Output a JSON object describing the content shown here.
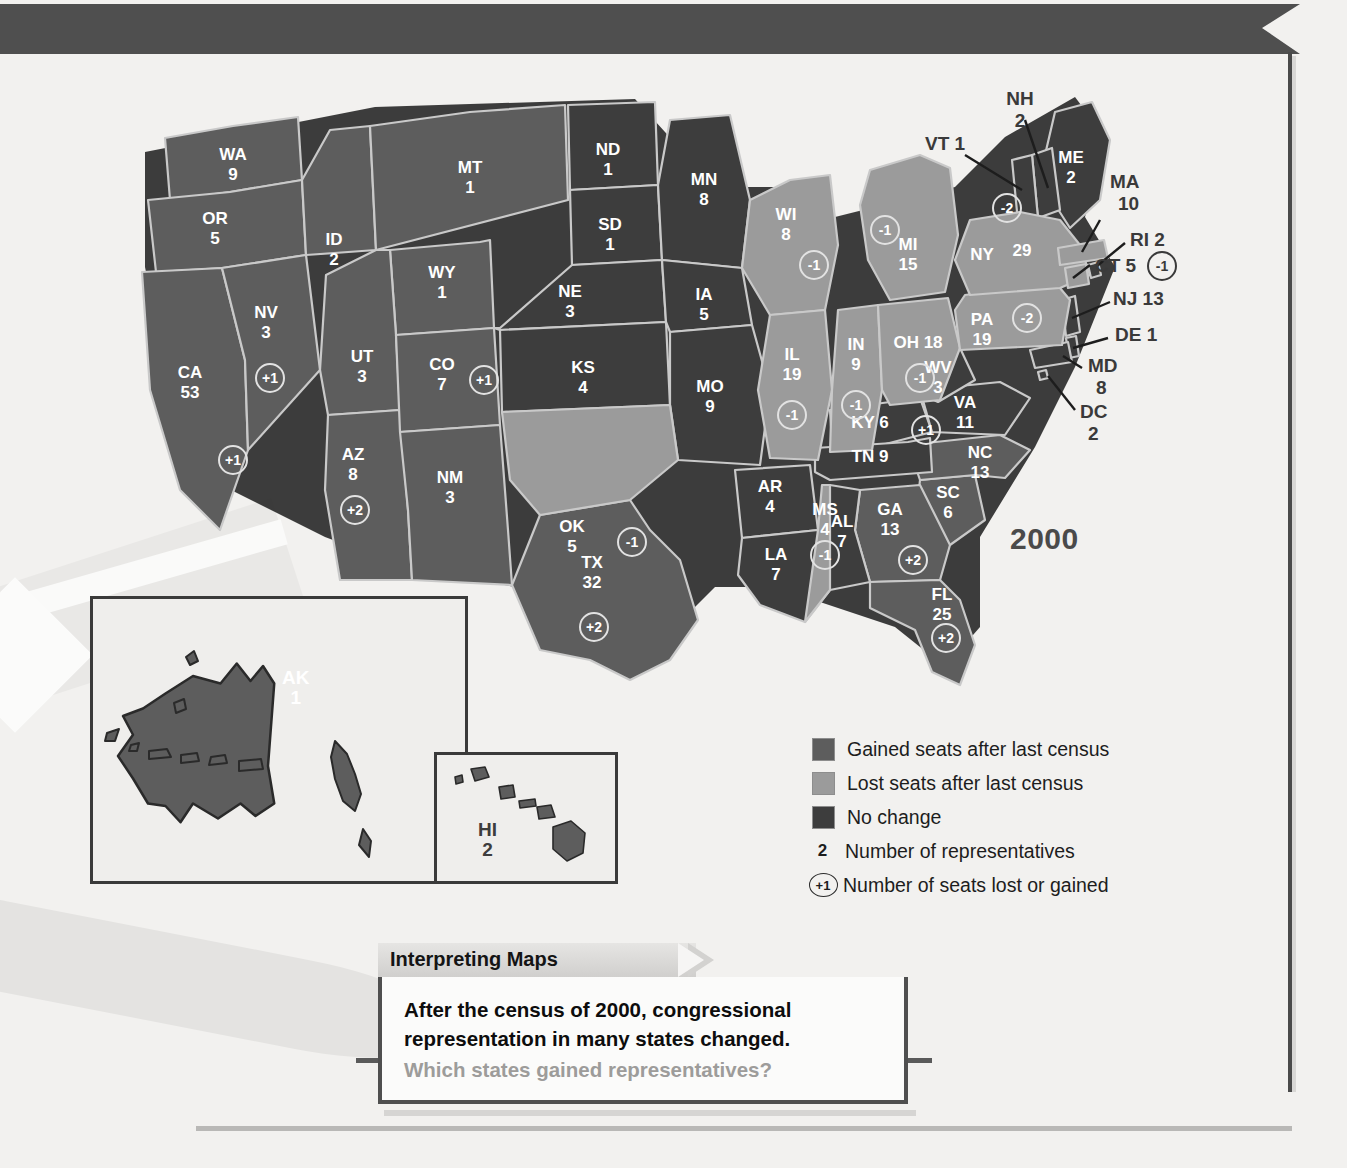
{
  "map": {
    "year_label": "2000",
    "title_domain": "congressional-apportionment-map"
  },
  "states": [
    {
      "code": "WA",
      "reps": "9",
      "change": null,
      "status": "gain"
    },
    {
      "code": "OR",
      "reps": "5",
      "change": null,
      "status": "gain"
    },
    {
      "code": "CA",
      "reps": "53",
      "change": "+1",
      "status": "gain"
    },
    {
      "code": "NV",
      "reps": "3",
      "change": "+1",
      "status": "gain"
    },
    {
      "code": "ID",
      "reps": "2",
      "change": null,
      "status": "gain"
    },
    {
      "code": "MT",
      "reps": "1",
      "change": null,
      "status": "gain"
    },
    {
      "code": "WY",
      "reps": "1",
      "change": null,
      "status": "gain"
    },
    {
      "code": "UT",
      "reps": "3",
      "change": null,
      "status": "gain"
    },
    {
      "code": "AZ",
      "reps": "8",
      "change": "+2",
      "status": "gain"
    },
    {
      "code": "CO",
      "reps": "7",
      "change": "+1",
      "status": "gain"
    },
    {
      "code": "NM",
      "reps": "3",
      "change": null,
      "status": "gain"
    },
    {
      "code": "ND",
      "reps": "1",
      "change": null,
      "status": "same"
    },
    {
      "code": "SD",
      "reps": "1",
      "change": null,
      "status": "same"
    },
    {
      "code": "NE",
      "reps": "3",
      "change": null,
      "status": "same"
    },
    {
      "code": "KS",
      "reps": "4",
      "change": null,
      "status": "same"
    },
    {
      "code": "OK",
      "reps": "5",
      "change": "-1",
      "status": "lose"
    },
    {
      "code": "TX",
      "reps": "32",
      "change": "+2",
      "status": "gain"
    },
    {
      "code": "MN",
      "reps": "8",
      "change": null,
      "status": "same"
    },
    {
      "code": "IA",
      "reps": "5",
      "change": null,
      "status": "same"
    },
    {
      "code": "MO",
      "reps": "9",
      "change": null,
      "status": "same"
    },
    {
      "code": "AR",
      "reps": "4",
      "change": null,
      "status": "same"
    },
    {
      "code": "LA",
      "reps": "7",
      "change": null,
      "status": "same"
    },
    {
      "code": "WI",
      "reps": "8",
      "change": "-1",
      "status": "lose"
    },
    {
      "code": "IL",
      "reps": "19",
      "change": "-1",
      "status": "lose"
    },
    {
      "code": "MI",
      "reps": "15",
      "change": "-1",
      "status": "lose"
    },
    {
      "code": "IN",
      "reps": "9",
      "change": "-1",
      "status": "lose"
    },
    {
      "code": "OH",
      "reps": "18",
      "change": "-1",
      "status": "lose"
    },
    {
      "code": "KY",
      "reps": "6",
      "change": null,
      "status": "same"
    },
    {
      "code": "TN",
      "reps": "9",
      "change": null,
      "status": "same"
    },
    {
      "code": "MS",
      "reps": "4",
      "change": "-1",
      "status": "lose"
    },
    {
      "code": "AL",
      "reps": "7",
      "change": null,
      "status": "same"
    },
    {
      "code": "GA",
      "reps": "13",
      "change": "+2",
      "status": "gain"
    },
    {
      "code": "FL",
      "reps": "25",
      "change": "+2",
      "status": "gain"
    },
    {
      "code": "SC",
      "reps": "6",
      "change": null,
      "status": "gain"
    },
    {
      "code": "NC",
      "reps": "13",
      "change": "+1",
      "status": "gain"
    },
    {
      "code": "VA",
      "reps": "11",
      "change": null,
      "status": "same"
    },
    {
      "code": "WV",
      "reps": "3",
      "change": null,
      "status": "same"
    },
    {
      "code": "PA",
      "reps": "19",
      "change": "-2",
      "status": "lose"
    },
    {
      "code": "NY",
      "reps": "29",
      "change": "-2",
      "status": "lose"
    },
    {
      "code": "ME",
      "reps": "2",
      "change": null,
      "status": "same"
    },
    {
      "code": "NH",
      "reps": "2",
      "change": null,
      "status": "same"
    },
    {
      "code": "VT",
      "reps": "1",
      "change": null,
      "status": "same"
    },
    {
      "code": "MA",
      "reps": "10",
      "change": null,
      "status": "lose"
    },
    {
      "code": "RI",
      "reps": "2",
      "change": null,
      "status": "same"
    },
    {
      "code": "CT",
      "reps": "5",
      "change": "-1",
      "status": "lose"
    },
    {
      "code": "NJ",
      "reps": "13",
      "change": null,
      "status": "same"
    },
    {
      "code": "DE",
      "reps": "1",
      "change": null,
      "status": "same"
    },
    {
      "code": "MD",
      "reps": "8",
      "change": null,
      "status": "same"
    },
    {
      "code": "DC",
      "reps": "2",
      "change": null,
      "status": "same"
    },
    {
      "code": "AK",
      "reps": "1",
      "change": null,
      "status": "gain"
    },
    {
      "code": "HI",
      "reps": "2",
      "change": null,
      "status": "gain"
    }
  ],
  "state_labels": {
    "WA": "WA",
    "WA_n": "9",
    "OR": "OR",
    "OR_n": "5",
    "CA": "CA",
    "CA_n": "53",
    "NV": "NV",
    "NV_n": "3",
    "ID": "ID",
    "ID_n": "2",
    "MT": "MT",
    "MT_n": "1",
    "WY": "WY",
    "WY_n": "1",
    "UT": "UT",
    "UT_n": "3",
    "AZ": "AZ",
    "AZ_n": "8",
    "CO": "CO",
    "CO_n": "7",
    "NM": "NM",
    "NM_n": "3",
    "ND": "ND",
    "ND_n": "1",
    "SD": "SD",
    "SD_n": "1",
    "NE": "NE",
    "NE_n": "3",
    "KS": "KS",
    "KS_n": "4",
    "OK": "OK",
    "OK_n": "5",
    "TX": "TX",
    "TX_n": "32",
    "MN": "MN",
    "MN_n": "8",
    "IA": "IA",
    "IA_n": "5",
    "MO": "MO",
    "MO_n": "9",
    "AR": "AR",
    "AR_n": "4",
    "LA": "LA",
    "LA_n": "7",
    "WI": "WI",
    "WI_n": "8",
    "IL": "IL",
    "IL_n": "19",
    "MI": "MI",
    "MI_n": "15",
    "IN": "IN",
    "IN_n": "9",
    "OH": "OH 18",
    "KY": "KY 6",
    "TN": "TN 9",
    "MS": "MS",
    "MS_n": "4",
    "AL": "AL",
    "AL_n": "7",
    "GA": "GA",
    "GA_n": "13",
    "FL": "FL",
    "FL_n": "25",
    "SC": "SC",
    "SC_n": "6",
    "NC": "NC",
    "NC_n": "13",
    "VA": "VA",
    "VA_n": "11",
    "WV": "WV",
    "WV_n": "3",
    "PA": "PA",
    "PA_n": "19",
    "NY": "NY",
    "NY_n": "29",
    "ME": "ME",
    "ME_n": "2",
    "AK": "AK",
    "AK_n": "1",
    "HI": "HI",
    "HI_n": "2"
  },
  "callouts": [
    {
      "id": "NH",
      "line1": "NH",
      "line2": "2"
    },
    {
      "id": "VT",
      "line1": "VT 1",
      "line2": ""
    },
    {
      "id": "MA",
      "line1": "MA",
      "line2": "10"
    },
    {
      "id": "RI",
      "line1": "RI 2",
      "line2": ""
    },
    {
      "id": "CT",
      "line1": "CT 5",
      "line2": "",
      "chip": "-1"
    },
    {
      "id": "NJ",
      "line1": "NJ 13",
      "line2": ""
    },
    {
      "id": "DE",
      "line1": "DE 1",
      "line2": ""
    },
    {
      "id": "MD",
      "line1": "MD",
      "line2": "8"
    },
    {
      "id": "DC",
      "line1": "DC",
      "line2": "2"
    }
  ],
  "chips": {
    "NV": "+1",
    "CA": "+1",
    "AZ": "+2",
    "CO": "+1",
    "OK": "-1",
    "TX": "+2",
    "WI": "-1",
    "IL": "-1",
    "MI": "-1",
    "IN": "-1",
    "OH": "-1",
    "MS": "-1",
    "GA": "+2",
    "FL": "+2",
    "NC": "+1",
    "PA": "-2",
    "NY": "-2",
    "CT": "-1"
  },
  "legend": {
    "items": [
      {
        "swatch": "gain",
        "label": "Gained seats after last census"
      },
      {
        "swatch": "lose",
        "label": "Lost seats after last census"
      },
      {
        "swatch": "same",
        "label": "No change"
      },
      {
        "swatch": "number",
        "marker": "2",
        "label": "Number of representatives"
      },
      {
        "swatch": "chip",
        "marker": "+1",
        "label": "Number of seats lost or gained"
      }
    ]
  },
  "caption": {
    "tab_title": "Interpreting Maps",
    "line1": "After the census of 2000, congressional",
    "line2": "representation in many states changed.",
    "question": "Which states gained representatives?"
  },
  "colors": {
    "gained": "#5d5d5d",
    "lost": "#9b9b9b",
    "no_change": "#3d3d3d",
    "banner": "#4f4f4f",
    "page_bg": "#f2f1ef"
  }
}
